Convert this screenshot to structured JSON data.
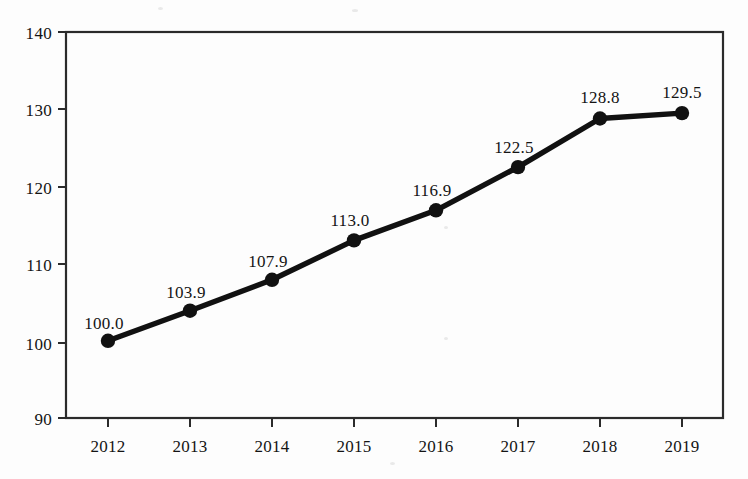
{
  "chart_data": {
    "type": "line",
    "title": "",
    "subtitle": "",
    "xlabel": "",
    "ylabel": "",
    "categories": [
      "2012",
      "2013",
      "2014",
      "2015",
      "2016",
      "2017",
      "2018",
      "2019"
    ],
    "values": [
      100.0,
      103.9,
      107.9,
      113.0,
      116.9,
      122.5,
      128.8,
      129.5
    ],
    "point_labels": [
      "100.0",
      "103.9",
      "107.9",
      "113.0",
      "116.9",
      "122.5",
      "128.8",
      "129.5"
    ],
    "ylim": [
      90,
      140
    ],
    "y_ticks": [
      90,
      100,
      110,
      120,
      130,
      140
    ],
    "y_tick_labels": [
      "90",
      "100",
      "110",
      "120",
      "130",
      "140"
    ],
    "x_tick_labels": [
      "2012",
      "2013",
      "2014",
      "2015",
      "2016",
      "2017",
      "2018",
      "2019"
    ],
    "grid": false,
    "legend": null,
    "legend_position": "none",
    "marker": "filled-circle",
    "line_color": "#111111",
    "marker_color": "#111111",
    "axis_color": "#2b2b2b",
    "background_color": "#fdfdfd",
    "annotations": []
  },
  "axes": {
    "y_axis_name": "value-axis",
    "x_axis_name": "year-axis"
  }
}
